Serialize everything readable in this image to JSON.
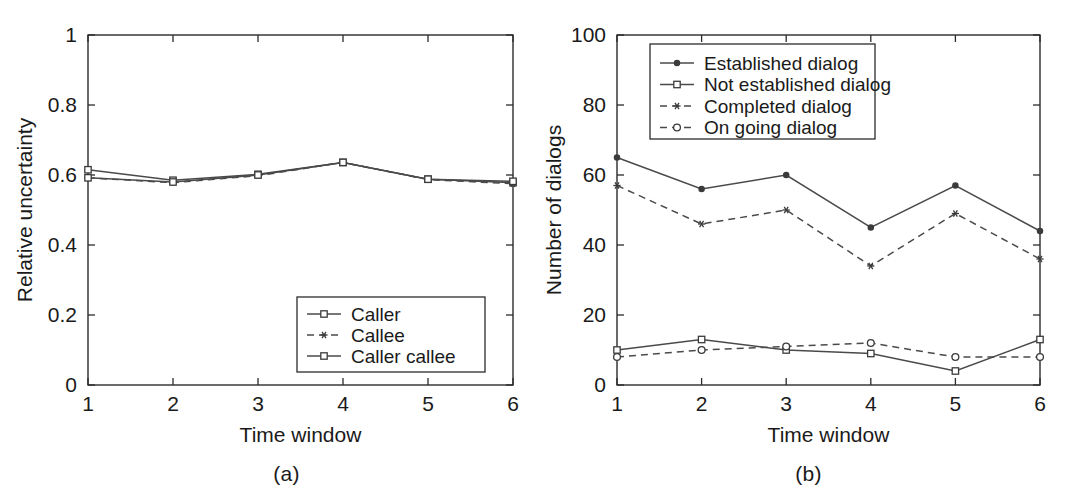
{
  "figure": {
    "panels": [
      {
        "caption": "(a)",
        "xlabel": "Time window",
        "ylabel": "Relative uncertainty"
      },
      {
        "caption": "(b)",
        "xlabel": "Time window",
        "ylabel": "Number of dialogs"
      }
    ]
  },
  "chart_data": [
    {
      "type": "line",
      "panel": "(a)",
      "title": "",
      "xlabel": "Time window",
      "ylabel": "Relative uncertainty",
      "x": [
        1,
        2,
        3,
        4,
        5,
        6
      ],
      "xticklabels": [
        "1",
        "2",
        "3",
        "4",
        "5",
        "6"
      ],
      "yticks": [
        0,
        0.2,
        0.4,
        0.6,
        0.8,
        1
      ],
      "yticklabels": [
        "0",
        "0.2",
        "0.4",
        "0.6",
        "0.8",
        "1"
      ],
      "xlim": [
        1,
        6
      ],
      "ylim": [
        0,
        1
      ],
      "grid": false,
      "legend_position": "lower right",
      "series": [
        {
          "name": "Caller",
          "linestyle": "solid",
          "marker": "square-open",
          "values": [
            0.615,
            0.585,
            0.602,
            0.636,
            0.588,
            0.578
          ]
        },
        {
          "name": "Callee",
          "linestyle": "dashed",
          "marker": "asterisk",
          "values": [
            0.592,
            0.578,
            0.598,
            0.636,
            0.587,
            0.575
          ]
        },
        {
          "name": "Caller callee",
          "linestyle": "solid",
          "marker": "square-open",
          "values": [
            0.592,
            0.58,
            0.6,
            0.636,
            0.588,
            0.582
          ]
        }
      ]
    },
    {
      "type": "line",
      "panel": "(b)",
      "title": "",
      "xlabel": "Time window",
      "ylabel": "Number of dialogs",
      "x": [
        1,
        2,
        3,
        4,
        5,
        6
      ],
      "xticklabels": [
        "1",
        "2",
        "3",
        "4",
        "5",
        "6"
      ],
      "yticks": [
        0,
        20,
        40,
        60,
        80,
        100
      ],
      "yticklabels": [
        "0",
        "20",
        "40",
        "60",
        "80",
        "100"
      ],
      "xlim": [
        1,
        6
      ],
      "ylim": [
        0,
        100
      ],
      "grid": false,
      "legend_position": "upper center",
      "series": [
        {
          "name": "Established dialog",
          "linestyle": "solid",
          "marker": "dot-filled",
          "values": [
            65,
            56,
            60,
            45,
            57,
            44
          ]
        },
        {
          "name": "Not established dialog",
          "linestyle": "solid",
          "marker": "square-open",
          "values": [
            10,
            13,
            10,
            9,
            4,
            13
          ]
        },
        {
          "name": "Completed dialog",
          "linestyle": "dashed",
          "marker": "asterisk",
          "values": [
            57,
            46,
            50,
            34,
            49,
            36
          ]
        },
        {
          "name": "On going dialog",
          "linestyle": "dashed",
          "marker": "circle-open",
          "values": [
            8,
            10,
            11,
            12,
            8,
            8
          ]
        }
      ]
    }
  ]
}
